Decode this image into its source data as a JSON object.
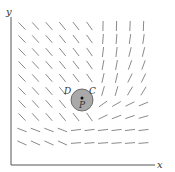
{
  "figure": {
    "type": "vector-field",
    "axes": {
      "x_label": "x",
      "y_label": "y"
    },
    "labels": {
      "region": "D",
      "boundary": "C",
      "point": "P"
    },
    "colors": {
      "axis": "#555555",
      "vectors": "#8a8a8a",
      "disk_fill": "#a9a9a9",
      "disk_stroke": "#555555",
      "text": "#333333"
    },
    "disk": {
      "cx": 82,
      "cy": 100,
      "r": 11
    },
    "point": {
      "cx": 82,
      "cy": 98
    },
    "grid": {
      "x0": 22,
      "y0": 26,
      "dx": 13.5,
      "dy": 13,
      "cols": 10,
      "rows": 10,
      "len": 10
    }
  }
}
